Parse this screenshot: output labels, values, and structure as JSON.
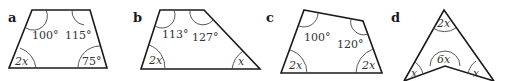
{
  "figures": [
    {
      "label": "a",
      "angles": {
        "top_left": "100°",
        "top_right": "115°",
        "bottom_left": "2x",
        "bottom_right": "75°"
      }
    },
    {
      "label": "b",
      "angles": {
        "top_left": "113°",
        "top_right": "127°",
        "bottom_left": "2x",
        "bottom_right": "x"
      }
    },
    {
      "label": "c",
      "angles": {
        "top_left": "100°",
        "top_right": "120°",
        "bottom_left": "2x",
        "bottom_right": "2x"
      }
    },
    {
      "label": "d",
      "angles": {
        "apex": "2x",
        "reflex": "6x",
        "bottom_left": "x",
        "bottom_right": "x"
      }
    }
  ]
}
